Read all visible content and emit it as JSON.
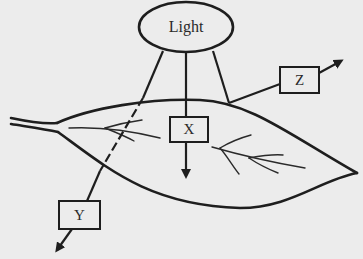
{
  "diagram": {
    "source": {
      "label": "Light",
      "shape": "ellipse"
    },
    "arrows": [
      {
        "id": "X",
        "label": "X",
        "meaning-position": "passes down through leaf",
        "style": "solid"
      },
      {
        "id": "Y",
        "label": "Y",
        "meaning-position": "passes through leaf (dashed inside) and out below",
        "style": "dashed-then-solid"
      },
      {
        "id": "Z",
        "label": "Z",
        "meaning-position": "reflected off leaf surface",
        "style": "solid"
      }
    ],
    "object": {
      "label": "",
      "shape": "leaf"
    },
    "colors": {
      "background": "#ececec",
      "stroke": "#1e1e1e",
      "box_fill": "#ececec"
    }
  }
}
